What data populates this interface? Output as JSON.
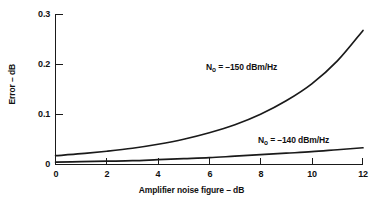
{
  "chart_data": {
    "type": "line",
    "title": "",
    "subtitle": "",
    "xlabel": "Amplifier noise figure – dB",
    "ylabel": "Error – dB",
    "xlim": [
      0,
      12
    ],
    "ylim": [
      0,
      0.3
    ],
    "xticks": [
      0,
      2,
      4,
      6,
      8,
      10,
      12
    ],
    "yticks": [
      0,
      0.1,
      0.2,
      0.3
    ],
    "xtick_labels": [
      "0",
      "2",
      "4",
      "6",
      "8",
      "10",
      "12"
    ],
    "ytick_labels": [
      "0",
      "0.1",
      "0.2",
      "0.3"
    ],
    "grid": false,
    "legend": "inline-annotations",
    "line_color": "#1a1a1a",
    "background_color": "#ffffff",
    "series": [
      {
        "name": "N₀ = –150 dBm/Hz",
        "annotation": "N₀ = –150 dBm/Hz",
        "annotation_symbol": "N",
        "annotation_subscript": "o",
        "annotation_value": "= –150 dBm/Hz",
        "x": [
          0,
          1,
          2,
          3,
          4,
          5,
          6,
          7,
          8,
          9,
          10,
          11,
          12
        ],
        "values": [
          0.017,
          0.021,
          0.026,
          0.032,
          0.04,
          0.05,
          0.063,
          0.079,
          0.1,
          0.127,
          0.161,
          0.207,
          0.268
        ]
      },
      {
        "name": "N₀ = –140 dBm/Hz",
        "annotation": "N₀ = –140 dBm/Hz",
        "annotation_symbol": "N",
        "annotation_subscript": "o",
        "annotation_value": "= –140 dBm/Hz",
        "x": [
          0,
          1,
          2,
          3,
          4,
          5,
          6,
          7,
          8,
          9,
          10,
          11,
          12
        ],
        "values": [
          0.004,
          0.005,
          0.006,
          0.007,
          0.009,
          0.011,
          0.013,
          0.016,
          0.019,
          0.022,
          0.025,
          0.029,
          0.033
        ]
      }
    ]
  },
  "axes": {
    "x_title": "Amplifier noise figure – dB",
    "y_title": "Error – dB"
  }
}
